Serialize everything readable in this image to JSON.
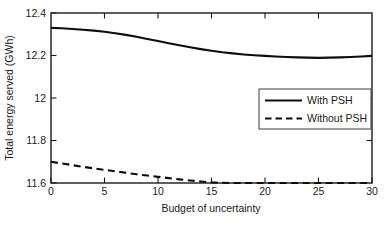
{
  "chart_data": {
    "type": "line",
    "title": "",
    "xlabel": "Budget of uncertainty",
    "ylabel": "Total energy served (GWh)",
    "xlim": [
      0,
      30
    ],
    "ylim": [
      11.6,
      12.4
    ],
    "xticks": [
      0,
      5,
      10,
      15,
      20,
      25,
      30
    ],
    "xtick_labels": [
      "0",
      "5",
      "10",
      "15",
      "20",
      "25",
      "30"
    ],
    "yticks": [
      11.6,
      11.8,
      12,
      12.2,
      12.4
    ],
    "ytick_labels": [
      "11.6",
      "11.8",
      "12",
      "12.2",
      "12.4"
    ],
    "grid": false,
    "legend_position": "center-right",
    "x": [
      0,
      1,
      2,
      3,
      4,
      5,
      6,
      7,
      8,
      9,
      10,
      11,
      12,
      13,
      14,
      15,
      16,
      17,
      18,
      19,
      20,
      21,
      22,
      23,
      24,
      25,
      26,
      27,
      28,
      29,
      30
    ],
    "series": [
      {
        "name": "With PSH",
        "style": "solid",
        "color": "#0d0d0d",
        "values": [
          12.33,
          12.328,
          12.325,
          12.321,
          12.317,
          12.312,
          12.305,
          12.297,
          12.288,
          12.278,
          12.268,
          12.258,
          12.248,
          12.239,
          12.23,
          12.222,
          12.215,
          12.21,
          12.205,
          12.201,
          12.198,
          12.195,
          12.193,
          12.191,
          12.19,
          12.189,
          12.19,
          12.191,
          12.193,
          12.195,
          12.198
        ]
      },
      {
        "name": "Without PSH",
        "style": "dashed",
        "color": "#0d0d0d",
        "values": [
          11.7,
          11.692,
          11.684,
          11.676,
          11.669,
          11.662,
          11.655,
          11.648,
          11.641,
          11.635,
          11.629,
          11.623,
          11.617,
          11.612,
          11.607,
          11.603,
          11.601,
          11.6,
          11.6,
          11.6,
          11.6,
          11.6,
          11.6,
          11.6,
          11.6,
          11.6,
          11.6,
          11.6,
          11.6,
          11.6,
          11.6
        ]
      }
    ],
    "legend": [
      "With PSH",
      "Without PSH"
    ]
  },
  "axis": {
    "x_title": "Budget of uncertainty",
    "y_title": "Total energy served (GWh)"
  },
  "legend": {
    "item_0": "With PSH",
    "item_1": "Without PSH"
  },
  "xticks": {
    "t0": "0",
    "t1": "5",
    "t2": "10",
    "t3": "15",
    "t4": "20",
    "t5": "25",
    "t6": "30"
  },
  "yticks": {
    "t0": "11.6",
    "t1": "11.8",
    "t2": "12",
    "t3": "12.2",
    "t4": "12.4"
  },
  "colors": {
    "line": "#0d0d0d",
    "axis": "#1a1a1a",
    "background": "#ffffff"
  }
}
